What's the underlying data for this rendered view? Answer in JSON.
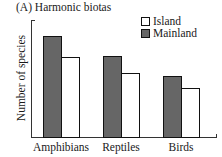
{
  "chart_data": {
    "type": "bar",
    "title": "(A)  Harmonic biotas",
    "xlabel": "",
    "ylabel": "Number of species",
    "categories": [
      "Amphibians",
      "Reptiles",
      "Birds"
    ],
    "series": [
      {
        "name": "Mainland",
        "color": "#666666",
        "values": [
          86,
          69,
          52
        ]
      },
      {
        "name": "Island",
        "color": "#ffffff",
        "values": [
          68,
          55,
          42
        ]
      }
    ],
    "ylim": [
      0,
      100
    ],
    "grid": false,
    "legend_position": "upper right",
    "y_ticks_labeled": false
  },
  "legend": {
    "island": "Island",
    "mainland": "Mainland"
  }
}
